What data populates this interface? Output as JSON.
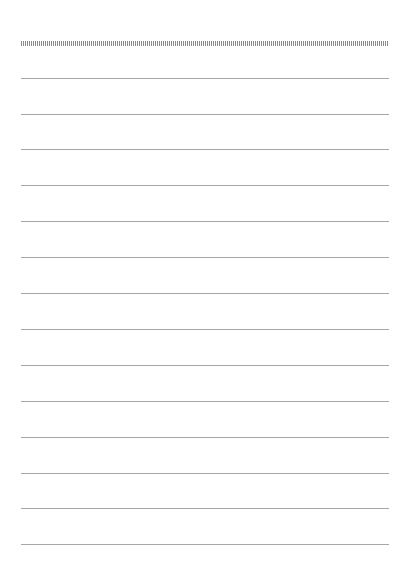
{
  "page": {
    "type": "lined-paper",
    "background_color": "#ffffff",
    "line_color": "#a6a6a6",
    "tick_color": "#8c8c8c",
    "tick_strip": {
      "top": 41,
      "left": 21,
      "width": 368,
      "height": 5
    },
    "rules": [
      {
        "top": 78
      },
      {
        "top": 114
      },
      {
        "top": 149
      },
      {
        "top": 185
      },
      {
        "top": 221
      },
      {
        "top": 257
      },
      {
        "top": 293
      },
      {
        "top": 329
      },
      {
        "top": 365
      },
      {
        "top": 401
      },
      {
        "top": 437
      },
      {
        "top": 473
      },
      {
        "top": 508
      },
      {
        "top": 544
      }
    ]
  }
}
